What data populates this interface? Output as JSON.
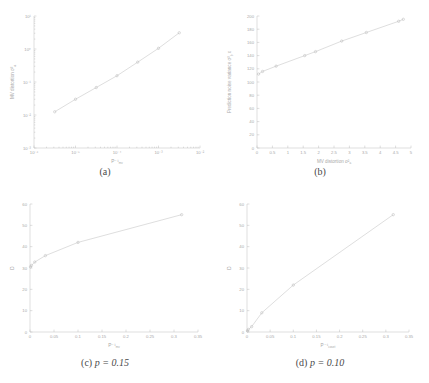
{
  "figure": {
    "background": "#ffffff",
    "line_color": "#c2c2c2",
    "axis_color": "#bdbdbd",
    "text_color": "#a8a8a8",
    "caption_color": "#4a4a4a"
  },
  "captions": {
    "a": "(a)",
    "b": "(b)",
    "c_prefix": "(c)",
    "c_expr": "p = 0.15",
    "d_prefix": "(d)",
    "d_expr": "p = 0.10"
  },
  "chart_data": [
    {
      "id": "a",
      "type": "line",
      "title": "",
      "xlabel": "P⁻¹",
      "xlabel_sub": "mv",
      "ylabel": "MV distortion σ²",
      "ylabel_sub": "a",
      "xscale": "log",
      "yscale": "log",
      "xlim": [
        1e-06,
        0.01
      ],
      "ylim": [
        0.001,
        10
      ],
      "xticks": [
        1e-06,
        1e-05,
        0.0001,
        0.001,
        0.01
      ],
      "xticklabels": [
        "10⁻⁶",
        "10⁻⁵",
        "10⁻⁴",
        "10⁻³",
        "10⁻²"
      ],
      "yticks": [
        0.001,
        0.01,
        0.1,
        1,
        10
      ],
      "yticklabels": [
        "10⁻³",
        "10⁻²",
        "10⁻¹",
        "10⁰",
        "10¹"
      ],
      "grid": false,
      "legend": "none",
      "marker": "o",
      "x": [
        3.16e-06,
        1e-05,
        3.16e-05,
        0.0001,
        0.000316,
        0.001,
        0.00316
      ],
      "y": [
        0.0125,
        0.03,
        0.068,
        0.155,
        0.4,
        1.05,
        3.1
      ]
    },
    {
      "id": "b",
      "type": "line",
      "title": "",
      "xlabel": "MV distortion σ²",
      "xlabel_sub": "a",
      "ylabel": "Prediction noise variance σ²",
      "ylabel_sub": "b",
      "ylabel_suffix": "x",
      "xscale": "linear",
      "yscale": "linear",
      "xlim": [
        0,
        5
      ],
      "ylim": [
        0,
        200
      ],
      "xticks": [
        0,
        0.5,
        1,
        1.5,
        2,
        2.5,
        3,
        3.5,
        4,
        4.5,
        5
      ],
      "xticklabels": [
        "0",
        "0.5",
        "1",
        "1.5",
        "2",
        "2.5",
        "3",
        "3.5",
        "4",
        "4.5",
        "5"
      ],
      "yticks": [
        0,
        20,
        40,
        60,
        80,
        100,
        120,
        140,
        160,
        180,
        200
      ],
      "yticklabels": [
        "0",
        "20",
        "40",
        "60",
        "80",
        "100",
        "120",
        "140",
        "160",
        "180",
        "200"
      ],
      "grid": false,
      "legend": "none",
      "marker": "o",
      "x": [
        0.05,
        0.18,
        0.62,
        1.55,
        1.9,
        2.75,
        3.55,
        4.6,
        4.75
      ],
      "y": [
        112,
        116,
        124,
        140,
        146,
        162,
        175,
        192,
        195
      ]
    },
    {
      "id": "c",
      "type": "line",
      "title": "",
      "xlabel": "P⁻¹",
      "xlabel_sub": "mv",
      "ylabel": "D",
      "xscale": "linear",
      "yscale": "linear",
      "xlim": [
        0,
        0.35
      ],
      "ylim": [
        0,
        60
      ],
      "xticks": [
        0,
        0.05,
        0.1,
        0.15,
        0.2,
        0.25,
        0.3,
        0.35
      ],
      "xticklabels": [
        "0",
        "0.05",
        "0.1",
        "0.15",
        "0.2",
        "0.25",
        "0.3",
        "0.35"
      ],
      "yticks": [
        0,
        10,
        20,
        30,
        40,
        50,
        60
      ],
      "yticklabels": [
        "0",
        "10",
        "20",
        "30",
        "40",
        "50",
        "60"
      ],
      "grid": false,
      "legend": "none",
      "marker": "o",
      "x": [
        0.001,
        0.003,
        0.01,
        0.032,
        0.1,
        0.316
      ],
      "y": [
        30.5,
        31.2,
        32.8,
        35.8,
        42.0,
        55.0
      ]
    },
    {
      "id": "d",
      "type": "line",
      "title": "",
      "xlabel": "P⁻¹",
      "xlabel_sub": "coset",
      "ylabel": "D",
      "xscale": "linear",
      "yscale": "linear",
      "xlim": [
        0,
        0.35
      ],
      "ylim": [
        0,
        60
      ],
      "xticks": [
        0,
        0.05,
        0.1,
        0.15,
        0.2,
        0.25,
        0.3,
        0.35
      ],
      "xticklabels": [
        "0",
        "0.05",
        "0.1",
        "0.15",
        "0.2",
        "0.25",
        "0.3",
        "0.35"
      ],
      "yticks": [
        0,
        10,
        20,
        30,
        40,
        50,
        60
      ],
      "yticklabels": [
        "0",
        "10",
        "20",
        "30",
        "40",
        "50",
        "60"
      ],
      "grid": false,
      "legend": "none",
      "marker": "o",
      "x": [
        0.001,
        0.003,
        0.01,
        0.032,
        0.1,
        0.316
      ],
      "y": [
        0.5,
        1.2,
        2.5,
        9.0,
        22.0,
        55.0
      ]
    }
  ]
}
